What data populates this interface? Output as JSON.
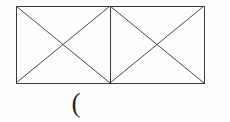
{
  "figure": {
    "background_color": "#fdfdfd",
    "stroke_color": "#3a3a3a",
    "stroke_width": 1,
    "canvas": {
      "width": 230,
      "height": 122
    },
    "outer_rectangle": {
      "label": "outer-rectangle",
      "x": 16,
      "y": 6,
      "width": 188,
      "height": 77,
      "right": 204,
      "bottom": 83
    },
    "divider": {
      "label": "vertical-divider",
      "x": 110,
      "y1": 6,
      "y2": 83
    },
    "cells": [
      {
        "name": "left-cell",
        "x1": 16,
        "y1": 6,
        "x2": 110,
        "y2": 83,
        "center_x": 63,
        "center_y": 44.5,
        "diagonals": [
          "top-left-to-bottom-right",
          "bottom-left-to-top-right"
        ]
      },
      {
        "name": "right-cell",
        "x1": 110,
        "y1": 6,
        "x2": 204,
        "y2": 83,
        "center_x": 157,
        "center_y": 44.5,
        "diagonals": [
          "top-left-to-bottom-right",
          "bottom-left-to-top-right"
        ]
      }
    ],
    "triangle_count": 8
  },
  "annotation": {
    "paren_symbol": "(",
    "paren_x": 73,
    "paren_y": 93,
    "paren_color": "#2b2b2b"
  }
}
